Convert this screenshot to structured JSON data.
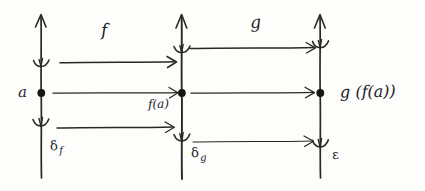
{
  "diagram": {
    "kind": "hand-drawn-math-sketch",
    "ink_color": "#2a2724",
    "paper_color": "#fdfdfb"
  },
  "axes": [
    {
      "id": "axis-domain",
      "name": "first-number-line",
      "x": 41,
      "top": 14,
      "bottom": 178,
      "point": {
        "label": "a",
        "y": 93
      },
      "neighborhood_label": "δ",
      "neighborhood_subscript": "f",
      "bracket_upper_y": 64,
      "bracket_lower_y": 123
    },
    {
      "id": "axis-middle",
      "name": "second-number-line",
      "x": 182,
      "top": 14,
      "bottom": 178,
      "point": {
        "label": "f(a)",
        "y": 93
      },
      "neighborhood_label": "δ",
      "neighborhood_subscript": "g",
      "bracket_upper_y": 50,
      "bracket_lower_y": 138
    },
    {
      "id": "axis-codomain",
      "name": "third-number-line",
      "x": 320,
      "top": 14,
      "bottom": 178,
      "point": {
        "label": "g(f(a))",
        "y": 93
      },
      "neighborhood_label": "ε",
      "neighborhood_subscript": "",
      "bracket_upper_y": 45,
      "bracket_lower_y": 144
    }
  ],
  "labels": {
    "point_a": "a",
    "point_fa": "f(a)",
    "point_gfa": "g (f(a))",
    "map_f": "f",
    "map_g": "g",
    "delta_f": "δ",
    "delta_f_sub": "f",
    "delta_g": "δ",
    "delta_g_sub": "g",
    "epsilon": "ε"
  },
  "arrows": [
    {
      "name": "arrow-f-upper",
      "from_x": 60,
      "to_x": 176,
      "y": 62,
      "group": "f"
    },
    {
      "name": "arrow-f-middle",
      "from_x": 53,
      "to_x": 178,
      "y": 93,
      "group": "f"
    },
    {
      "name": "arrow-f-lower",
      "from_x": 57,
      "to_x": 174,
      "y": 127,
      "group": "f"
    },
    {
      "name": "arrow-g-upper",
      "from_x": 190,
      "to_x": 315,
      "y": 48,
      "group": "g"
    },
    {
      "name": "arrow-g-middle",
      "from_x": 191,
      "to_x": 314,
      "y": 93,
      "group": "g"
    },
    {
      "name": "arrow-g-lower",
      "from_x": 193,
      "to_x": 313,
      "y": 141,
      "group": "g"
    }
  ],
  "label_positions": {
    "a": {
      "x": 18,
      "y": 85
    },
    "f": {
      "x": 101,
      "y": 22
    },
    "g": {
      "x": 250,
      "y": 14
    },
    "fa": {
      "x": 148,
      "y": 98
    },
    "gfa": {
      "x": 340,
      "y": 84
    },
    "delta_f": {
      "x": 50,
      "y": 139
    },
    "delta_g": {
      "x": 191,
      "y": 146
    },
    "epsilon": {
      "x": 330,
      "y": 148
    }
  }
}
